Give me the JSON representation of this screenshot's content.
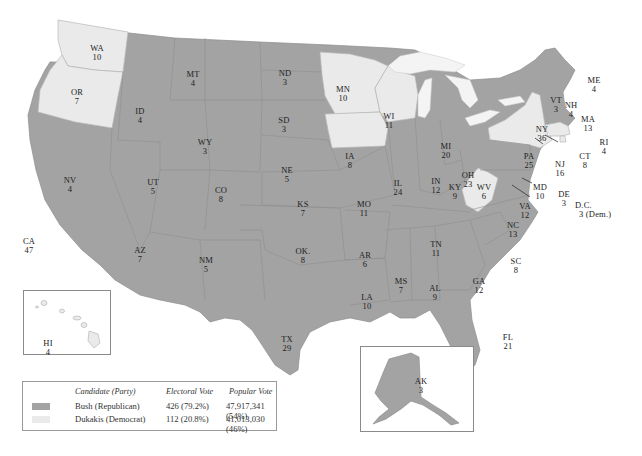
{
  "colors": {
    "republican": "#a3a3a3",
    "democrat": "#eaeaea"
  },
  "legend": {
    "headers": {
      "candidate": "Candidate (Party)",
      "electoral": "Electoral Vote",
      "popular": "Popular Vote"
    },
    "rows": [
      {
        "candidate": "Bush (Republican)",
        "electoral": "426 (79.2%)",
        "popular": "47,917,341 (54%)",
        "color": "#a3a3a3"
      },
      {
        "candidate": "Dukakis (Democrat)",
        "electoral": "112 (20.8%)",
        "popular": "41,013,030 (46%)",
        "color": "#eaeaea"
      }
    ]
  },
  "states": {
    "WA": {
      "abbr": "WA",
      "votes": "10",
      "party": "D"
    },
    "OR": {
      "abbr": "OR",
      "votes": "7",
      "party": "D"
    },
    "CA": {
      "abbr": "CA",
      "votes": "47",
      "party": "R"
    },
    "NV": {
      "abbr": "NV",
      "votes": "4",
      "party": "R"
    },
    "ID": {
      "abbr": "ID",
      "votes": "4",
      "party": "R"
    },
    "MT": {
      "abbr": "MT",
      "votes": "4",
      "party": "R"
    },
    "WY": {
      "abbr": "WY",
      "votes": "3",
      "party": "R"
    },
    "UT": {
      "abbr": "UT",
      "votes": "5",
      "party": "R"
    },
    "AZ": {
      "abbr": "AZ",
      "votes": "7",
      "party": "R"
    },
    "CO": {
      "abbr": "CO",
      "votes": "8",
      "party": "R"
    },
    "NM": {
      "abbr": "NM",
      "votes": "5",
      "party": "R"
    },
    "ND": {
      "abbr": "ND",
      "votes": "3",
      "party": "R"
    },
    "SD": {
      "abbr": "SD",
      "votes": "3",
      "party": "R"
    },
    "NE": {
      "abbr": "NE",
      "votes": "5",
      "party": "R"
    },
    "KS": {
      "abbr": "KS",
      "votes": "7",
      "party": "R"
    },
    "OK": {
      "abbr": "OK.",
      "votes": "8",
      "party": "R"
    },
    "TX": {
      "abbr": "TX",
      "votes": "29",
      "party": "R"
    },
    "MN": {
      "abbr": "MN",
      "votes": "10",
      "party": "D"
    },
    "IA": {
      "abbr": "IA",
      "votes": "8",
      "party": "D"
    },
    "MO": {
      "abbr": "MO",
      "votes": "11",
      "party": "R"
    },
    "AR": {
      "abbr": "AR",
      "votes": "6",
      "party": "R"
    },
    "LA": {
      "abbr": "LA",
      "votes": "10",
      "party": "R"
    },
    "WI": {
      "abbr": "WI",
      "votes": "11",
      "party": "D"
    },
    "IL": {
      "abbr": "IL",
      "votes": "24",
      "party": "R"
    },
    "MI": {
      "abbr": "MI",
      "votes": "20",
      "party": "R"
    },
    "IN": {
      "abbr": "IN",
      "votes": "12",
      "party": "R"
    },
    "OH": {
      "abbr": "OH",
      "votes": "23",
      "party": "R"
    },
    "KY": {
      "abbr": "KY",
      "votes": "9",
      "party": "R"
    },
    "TN": {
      "abbr": "TN",
      "votes": "11",
      "party": "R"
    },
    "MS": {
      "abbr": "MS",
      "votes": "7",
      "party": "R"
    },
    "AL": {
      "abbr": "AL",
      "votes": "9",
      "party": "R"
    },
    "GA": {
      "abbr": "GA",
      "votes": "12",
      "party": "R"
    },
    "FL": {
      "abbr": "FL",
      "votes": "21",
      "party": "R"
    },
    "SC": {
      "abbr": "SC",
      "votes": "8",
      "party": "R"
    },
    "NC": {
      "abbr": "NC",
      "votes": "13",
      "party": "R"
    },
    "VA": {
      "abbr": "VA",
      "votes": "12",
      "party": "R"
    },
    "WV": {
      "abbr": "WV",
      "votes": "6",
      "party": "D"
    },
    "PA": {
      "abbr": "PA",
      "votes": "25",
      "party": "R"
    },
    "NY": {
      "abbr": "NY",
      "votes": "36",
      "party": "D"
    },
    "NJ": {
      "abbr": "NJ",
      "votes": "16",
      "party": "R"
    },
    "MD": {
      "abbr": "MD",
      "votes": "10",
      "party": "R"
    },
    "DE": {
      "abbr": "DE",
      "votes": "3",
      "party": "R"
    },
    "DC": {
      "abbr": "D.C.",
      "votes": "3 (Dem.)",
      "party": "D"
    },
    "VT": {
      "abbr": "VT",
      "votes": "3",
      "party": "R"
    },
    "NH": {
      "abbr": "NH",
      "votes": "4",
      "party": "R"
    },
    "ME": {
      "abbr": "ME",
      "votes": "4",
      "party": "R"
    },
    "MA": {
      "abbr": "MA",
      "votes": "13",
      "party": "D"
    },
    "RI": {
      "abbr": "RI",
      "votes": "4",
      "party": "D"
    },
    "CT": {
      "abbr": "CT",
      "votes": "8",
      "party": "R"
    },
    "HI": {
      "abbr": "HI",
      "votes": "4",
      "party": "D"
    },
    "AK": {
      "abbr": "AK",
      "votes": "3",
      "party": "R"
    }
  }
}
